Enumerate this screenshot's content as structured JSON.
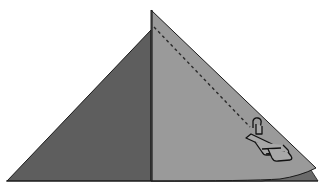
{
  "diagram": {
    "colors": {
      "background": "#ffffff",
      "left_panel": "#5e5e5e",
      "right_panel": "#9a9a9a",
      "under_layer": "#6a6a6a",
      "outline": "#1a1a1a",
      "stitch_line": "#2a2a2a",
      "presser_foot_fill": "#a8a8a8"
    },
    "elements": {
      "left_fabric_panel": "dark-gray-triangle",
      "right_fabric_flap": "light-gray-folded-flap",
      "under_layer_strip": "bottom-layer-corner",
      "stitch_line": "dashed-seam-line",
      "presser_foot": "sewing-machine-presser-foot-icon"
    }
  }
}
